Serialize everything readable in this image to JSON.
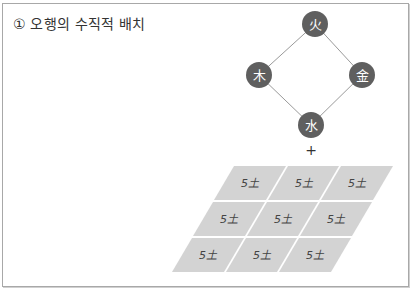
{
  "title": "① 오행의 수직적 배치",
  "colors": {
    "node_fill": "#5f5f5f",
    "edge": "#9a9a9a",
    "cell_fill": "#d3d3d3",
    "cell_gap": "#ffffff",
    "border": "#a8a8a8"
  },
  "diagram": {
    "nodes": [
      {
        "id": "fire",
        "label": "火",
        "cx": 315,
        "cy": 24
      },
      {
        "id": "wood",
        "label": "木",
        "cx": 259,
        "cy": 75
      },
      {
        "id": "metal",
        "label": "金",
        "cx": 362,
        "cy": 75
      },
      {
        "id": "water",
        "label": "水",
        "cx": 311,
        "cy": 125
      }
    ],
    "edges": [
      [
        "fire",
        "wood"
      ],
      [
        "fire",
        "metal"
      ],
      [
        "wood",
        "water"
      ],
      [
        "metal",
        "water"
      ]
    ],
    "plus": "+",
    "grid": {
      "rows": 3,
      "cols": 3,
      "cells": [
        [
          "5土",
          "5土",
          "5土"
        ],
        [
          "5土",
          "5土",
          "5土"
        ],
        [
          "5土",
          "5土",
          "5土"
        ]
      ]
    }
  }
}
